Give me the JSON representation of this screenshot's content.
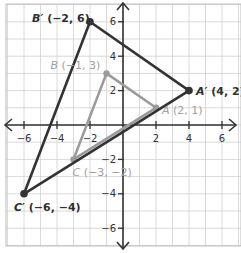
{
  "diagram": {
    "type": "coordinate-plane-dilation",
    "colors": {
      "grid": "#d0d0d0",
      "border": "#bdbdbd",
      "axis": "#333333",
      "image_triangle": "#333333",
      "preimage_triangle": "#9b9b9b",
      "image_label": "#2e2e2e",
      "preimage_label": "#a0a0a0"
    },
    "plane": {
      "origin_px": [
        123,
        125
      ],
      "unit_px_x": 16.5,
      "unit_px_y": 17.2,
      "grid_box": [
        6,
        4,
        241,
        246
      ],
      "x_range": [
        -7,
        7
      ],
      "y_range": [
        -7,
        7
      ]
    },
    "axes": {
      "x_tick_labels": [
        {
          "value": -6,
          "text": "−6"
        },
        {
          "value": -4,
          "text": "−4"
        },
        {
          "value": -2,
          "text": "−2"
        },
        {
          "value": 2,
          "text": "2"
        },
        {
          "value": 4,
          "text": "4"
        },
        {
          "value": 6,
          "text": "6"
        }
      ],
      "y_tick_labels": [
        {
          "value": 6,
          "text": "6"
        },
        {
          "value": 4,
          "text": "4"
        },
        {
          "value": 2,
          "text": "2"
        },
        {
          "value": -2,
          "text": "−2"
        },
        {
          "value": -4,
          "text": "−4"
        },
        {
          "value": -6,
          "text": "−6"
        }
      ]
    },
    "preimage": {
      "name": "triangle ABC",
      "points": [
        {
          "id": "A",
          "letter": "A",
          "coords_text": "(2, 1)",
          "x": 2,
          "y": 1,
          "label_dx": 6,
          "label_dy": 6
        },
        {
          "id": "B",
          "letter": "B",
          "coords_text": "(−1, 3)",
          "x": -1,
          "y": 3,
          "label_dx": -56,
          "label_dy": -4
        },
        {
          "id": "C",
          "letter": "C",
          "coords_text": "(−3, −2)",
          "x": -3,
          "y": -2,
          "label_dx": -1,
          "label_dy": 17
        }
      ]
    },
    "image": {
      "name": "triangle A'B'C'",
      "points": [
        {
          "id": "A'",
          "letter": "A′",
          "coords_text": "(4, 2)",
          "x": 4,
          "y": 2,
          "label_dx": 7,
          "label_dy": 4
        },
        {
          "id": "B'",
          "letter": "B′",
          "coords_text": "(−2, 6)",
          "x": -2,
          "y": 6,
          "label_dx": -58,
          "label_dy": 0
        },
        {
          "id": "C'",
          "letter": "C′",
          "coords_text": "(−6, −4)",
          "x": -6,
          "y": -4,
          "label_dx": -10,
          "label_dy": 17
        }
      ]
    }
  }
}
